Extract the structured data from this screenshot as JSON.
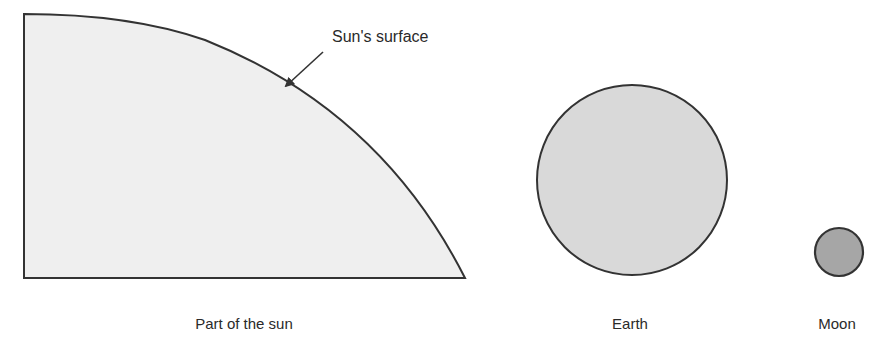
{
  "diagram": {
    "callout": {
      "text": "Sun's surface"
    },
    "labels": {
      "sun": "Part of the sun",
      "earth": "Earth",
      "moon": "Moon"
    },
    "colors": {
      "sun_fill": "#efefef",
      "earth_fill": "#d9d9d9",
      "moon_fill": "#a6a6a6",
      "outline": "#333333"
    }
  }
}
